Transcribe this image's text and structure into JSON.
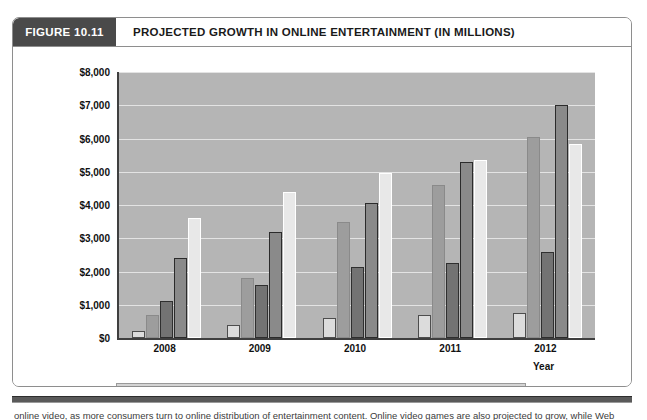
{
  "figure": {
    "number_label": "FIGURE 10.11",
    "title": "PROJECTED GROWTH IN ONLINE ENTERTAINMENT (IN MILLIONS)"
  },
  "caption": {
    "text": "online video, as more consumers turn to online distribution of entertainment content. Online video games are also projected to grow, while Web"
  },
  "colors": {
    "header_block": "#4a4a4a",
    "plot_background": "#b5b5b5",
    "gridline": "#e3e3e3",
    "axis": "#3f3f3f",
    "legend_background": "#d4d4d4",
    "series_online_video": "#dcdcdc",
    "series_internet_radio": "#9d9d9d",
    "series_online_tv": "#737373",
    "series_online_video_games": "#8a8a8a",
    "series_online_music": "#e8e8e8"
  },
  "chart_data": {
    "type": "bar",
    "title": "PROJECTED GROWTH IN ONLINE ENTERTAINMENT (IN MILLIONS)",
    "xlabel": "Year",
    "ylabel": "",
    "categories": [
      "2008",
      "2009",
      "2010",
      "2011",
      "2012"
    ],
    "ylim": [
      0,
      8000
    ],
    "yticks": [
      0,
      1000,
      2000,
      3000,
      4000,
      5000,
      6000,
      7000,
      8000
    ],
    "ytick_labels": [
      "$0",
      "$1,000",
      "$2,000",
      "$3,000",
      "$4,000",
      "$5,000",
      "$6,000",
      "$7,000",
      "$8,000"
    ],
    "grid": true,
    "legend_position": "bottom",
    "series": [
      {
        "name": "Online Video",
        "values": [
          200,
          400,
          600,
          700,
          750
        ]
      },
      {
        "name": "Internet Radio",
        "values": [
          700,
          1800,
          3500,
          4600,
          6050
        ]
      },
      {
        "name": "Online TV",
        "values": [
          1100,
          1600,
          2150,
          2250,
          2600
        ]
      },
      {
        "name": "Online Video Games",
        "values": [
          2400,
          3200,
          4050,
          5300,
          7000
        ]
      },
      {
        "name": "Online Music",
        "values": [
          3600,
          4400,
          4950,
          5350,
          5850
        ]
      }
    ]
  }
}
